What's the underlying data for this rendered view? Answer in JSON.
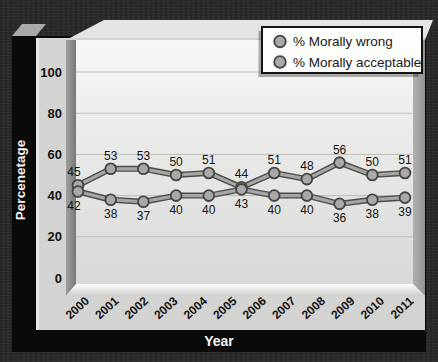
{
  "chart_data": {
    "type": "line",
    "title": "",
    "xlabel": "Year",
    "ylabel": "Percenetage",
    "x_axis_labels": [
      "2000",
      "2001",
      "2002",
      "2003",
      "2004",
      "2005",
      "2006",
      "2007",
      "2008",
      "2009",
      "2010",
      "2011"
    ],
    "y_ticks": [
      0,
      20,
      40,
      60,
      80,
      100
    ],
    "ylim": [
      0,
      110
    ],
    "grid": "horizontal",
    "legend_position": "top-right",
    "point_labels_shown": true,
    "series": [
      {
        "name": "% Morally wrong",
        "values": [
          45,
          53,
          53,
          50,
          51,
          44,
          51,
          48,
          56,
          50,
          51
        ]
      },
      {
        "name": "% Morally acceptable",
        "values": [
          42,
          38,
          37,
          40,
          40,
          43,
          40,
          40,
          36,
          38,
          39
        ]
      }
    ]
  },
  "colors": {
    "marker_fill": "#a8a8a6",
    "marker_stroke": "#454543",
    "line_fill": "#a6a6a4",
    "line_outline": "#4c4c4a",
    "grid_line": "#bdbdbb",
    "panel_face": "#d3d3d1",
    "frame_black": "#0a0a09",
    "background": "#2c2b29",
    "label_text": "#121210",
    "axis_title_text": "#f4f4f2",
    "legend_bg": "#fdfdfb",
    "legend_border": "#141412"
  }
}
